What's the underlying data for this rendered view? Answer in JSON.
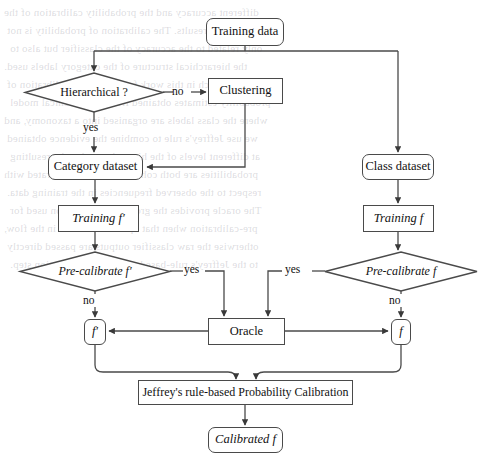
{
  "diagram": {
    "type": "flowchart",
    "background_color": "#ffffff",
    "line_color": "#4a4a4a",
    "text_color": "#111111",
    "nodes": [
      {
        "id": "training-data",
        "label": "Training data",
        "shape": "rounded-rect",
        "x": 206,
        "y": 18,
        "w": 78,
        "h": 28
      },
      {
        "id": "hierarchical",
        "label": "Hierarchical ?",
        "shape": "diamond",
        "x": 25,
        "y": 73,
        "w": 138,
        "h": 39
      },
      {
        "id": "clustering",
        "label": "Clustering",
        "shape": "rect",
        "x": 208,
        "y": 78,
        "w": 75,
        "h": 26
      },
      {
        "id": "category-dataset",
        "label": "Category dataset",
        "shape": "rounded-rect",
        "x": 48,
        "y": 154,
        "w": 95,
        "h": 26
      },
      {
        "id": "class-dataset",
        "label": "Class dataset",
        "shape": "rounded-rect",
        "x": 362,
        "y": 154,
        "w": 72,
        "h": 26
      },
      {
        "id": "training-fprime",
        "label": "Training f′",
        "shape": "rect",
        "x": 58,
        "y": 205,
        "w": 81,
        "h": 27
      },
      {
        "id": "training-f",
        "label": "Training f",
        "shape": "rect",
        "x": 363,
        "y": 205,
        "w": 71,
        "h": 27
      },
      {
        "id": "precal-fprime",
        "label": "Pre-calibrate f′",
        "shape": "diamond",
        "x": 20,
        "y": 252,
        "w": 150,
        "h": 39
      },
      {
        "id": "precal-f",
        "label": "Pre-calibrate f",
        "shape": "diamond",
        "x": 325,
        "y": 252,
        "w": 152,
        "h": 39
      },
      {
        "id": "fprime-node",
        "label": "f′",
        "shape": "rounded-rect",
        "x": 84,
        "y": 319,
        "w": 22,
        "h": 26
      },
      {
        "id": "f-node",
        "label": "f",
        "shape": "rounded-rect",
        "x": 391,
        "y": 319,
        "w": 20,
        "h": 26
      },
      {
        "id": "oracle",
        "label": "Oracle",
        "shape": "rect",
        "x": 208,
        "y": 318,
        "w": 77,
        "h": 27
      },
      {
        "id": "jeffreys",
        "label": "Jeffrey's rule-based Probability Calibration",
        "shape": "rect",
        "x": 138,
        "y": 380,
        "w": 215,
        "h": 25
      },
      {
        "id": "calibrated-f",
        "label": "Calibrated f",
        "shape": "rounded-rect",
        "x": 208,
        "y": 427,
        "w": 75,
        "h": 26
      }
    ],
    "edge_labels": [
      {
        "id": "no-hierarchical",
        "text": "no",
        "x": 172,
        "y": 85
      },
      {
        "id": "yes-hierarchical",
        "text": "yes",
        "x": 83,
        "y": 125
      },
      {
        "id": "yes-left",
        "text": "yes",
        "x": 185,
        "y": 263
      },
      {
        "id": "yes-right",
        "text": "yes",
        "x": 284,
        "y": 263
      },
      {
        "id": "no-left",
        "text": "no",
        "x": 84,
        "y": 297
      },
      {
        "id": "no-right",
        "text": "no",
        "x": 391,
        "y": 297
      }
    ],
    "edges": [
      {
        "from": "training-data",
        "to": "hierarchical",
        "label": ""
      },
      {
        "from": "training-data",
        "to": "class-dataset",
        "label": ""
      },
      {
        "from": "hierarchical",
        "to": "clustering",
        "label": "no"
      },
      {
        "from": "hierarchical",
        "to": "category-dataset",
        "label": "yes"
      },
      {
        "from": "clustering",
        "to": "category-dataset",
        "label": ""
      },
      {
        "from": "category-dataset",
        "to": "training-fprime",
        "label": ""
      },
      {
        "from": "class-dataset",
        "to": "training-f",
        "label": ""
      },
      {
        "from": "training-fprime",
        "to": "precal-fprime",
        "label": ""
      },
      {
        "from": "training-f",
        "to": "precal-f",
        "label": ""
      },
      {
        "from": "precal-fprime",
        "to": "oracle",
        "label": "yes"
      },
      {
        "from": "precal-f",
        "to": "oracle",
        "label": "yes"
      },
      {
        "from": "precal-fprime",
        "to": "fprime-node",
        "label": "no"
      },
      {
        "from": "precal-f",
        "to": "f-node",
        "label": "no"
      },
      {
        "from": "oracle",
        "to": "fprime-node",
        "label": ""
      },
      {
        "from": "oracle",
        "to": "f-node",
        "label": ""
      },
      {
        "from": "fprime-node",
        "to": "jeffreys",
        "label": ""
      },
      {
        "from": "f-node",
        "to": "jeffreys",
        "label": ""
      },
      {
        "from": "jeffreys",
        "to": "calibrated-f",
        "label": ""
      }
    ]
  },
  "page_background_text": {
    "note": "faint show-through of printed text from reverse side of the page",
    "lines": [
      "different accuracy and the probability calibration of the",
      "classification results. The calibration of probability is not",
      "only related to the accuracy of the classifier but also to",
      "the hierarchical structure of the category labels used.",
      "Our approach in this work focuses on the calibration of",
      "probability estimates obtained from a hierarchical model",
      "where the class labels are organised into a taxonomy, and",
      "we use Jeffrey's rule to combine the evidence obtained",
      "at different levels of the hierarchy so that the resulting",
      "probabilities are both coherent and well calibrated with",
      "respect to the observed frequencies in the training data.",
      "The oracle provides the ground-truth partition used for",
      "pre-calibration when that option is selected in the flow,",
      "otherwise the raw classifier outputs are passed directly",
      "to the Jeffrey's rule-based probability calibration step."
    ]
  }
}
